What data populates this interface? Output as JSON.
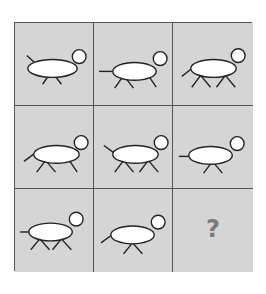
{
  "puzzle": {
    "type": "3x3 matrix reasoning",
    "colors": {
      "background": "#d5d5d5",
      "grid_line": "#555555",
      "body_fill": "#ffffff",
      "stroke": "#222222",
      "question_mark": "#7a7a7a"
    },
    "cells": [
      {
        "row": 1,
        "col": 1,
        "tail": "up",
        "legs": "one-pair"
      },
      {
        "row": 1,
        "col": 2,
        "tail": "horizontal",
        "legs": "pair-plus-single"
      },
      {
        "row": 1,
        "col": 3,
        "tail": "down",
        "legs": "two-pairs"
      },
      {
        "row": 2,
        "col": 1,
        "tail": "down",
        "legs": "pair-plus-single"
      },
      {
        "row": 2,
        "col": 2,
        "tail": "up",
        "legs": "two-pairs"
      },
      {
        "row": 2,
        "col": 3,
        "tail": "horizontal",
        "legs": "one-pair"
      },
      {
        "row": 3,
        "col": 1,
        "tail": "horizontal",
        "legs": "two-pairs"
      },
      {
        "row": 3,
        "col": 2,
        "tail": "down",
        "legs": "one-pair"
      },
      {
        "row": 3,
        "col": 3,
        "missing": true,
        "label": "?"
      }
    ]
  }
}
